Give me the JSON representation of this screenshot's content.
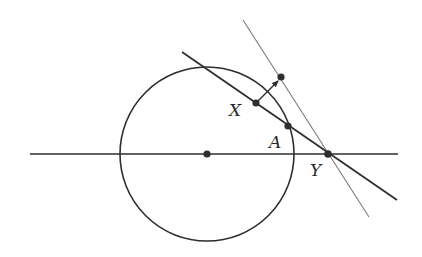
{
  "diagram": {
    "labels": {
      "X": "X",
      "A": "A",
      "Y": "Y"
    },
    "colors": {
      "stroke_dark": "#2e2e2e",
      "stroke_light": "#7a7a7a",
      "background": "#ffffff"
    },
    "geometry": {
      "circle": {
        "cx": 207,
        "cy": 154,
        "r": 87
      },
      "horizontal_line": {
        "x1": 30,
        "y1": 154,
        "x2": 398,
        "y2": 154
      },
      "secant_line": {
        "x1": 182,
        "y1": 52,
        "x2": 397,
        "y2": 200
      },
      "thin_line": {
        "x1": 243,
        "y1": 20,
        "x2": 369,
        "y2": 217
      },
      "arrow": {
        "x1": 256,
        "y1": 103,
        "x2": 278,
        "y2": 81
      },
      "points": {
        "center": {
          "x": 207,
          "y": 154
        },
        "X": {
          "x": 256,
          "y": 103
        },
        "A": {
          "x": 288,
          "y": 126
        },
        "Y": {
          "x": 328,
          "y": 154
        },
        "arrow_tip_point": {
          "x": 281,
          "y": 77
        }
      }
    }
  }
}
